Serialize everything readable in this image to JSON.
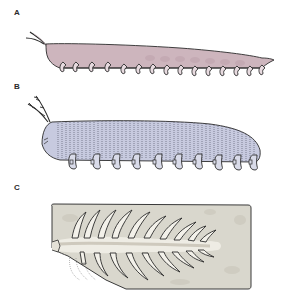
{
  "figure": {
    "panels": [
      {
        "label": "A",
        "description": "Side-view reconstruction, pink body with hooked legs",
        "body_color": "#cdb5bd",
        "leg_count": 15
      },
      {
        "label": "B",
        "description": "Side-view reconstruction, lavender annulated body with lobopod legs",
        "body_color": "#c7cadf",
        "leg_count": 10
      },
      {
        "label": "C",
        "description": "Fossil slab, dorsal view with spine-like appendages",
        "slab_color": "#d8d6cc"
      }
    ],
    "colors": {
      "outline": "#2b2b2b",
      "panel_a_fill": "#cdb5bd",
      "panel_b_fill": "#c7cadf",
      "slab_fill": "#d9d7cd",
      "fossil_axis": "#eeece4"
    }
  }
}
